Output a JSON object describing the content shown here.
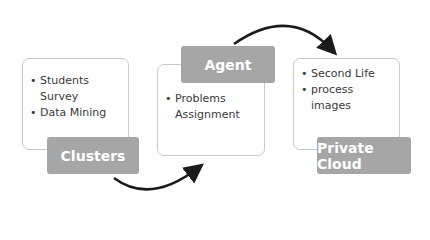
{
  "diagram": {
    "nodes": [
      {
        "label": "Clusters",
        "items": [
          "Students Survey",
          "Data Mining"
        ]
      },
      {
        "label": "Agent",
        "items": [
          "Problems Assignment"
        ]
      },
      {
        "label": "Private Cloud",
        "items": [
          "Second Life",
          "process images"
        ]
      }
    ],
    "edges": [
      {
        "from": "Clusters",
        "to": "Agent"
      },
      {
        "from": "Agent",
        "to": "Private Cloud"
      }
    ],
    "colors": {
      "label_bg": "#a6a6a6",
      "box_border": "#c8c8c8",
      "arrow": "#1a1a1a"
    }
  }
}
